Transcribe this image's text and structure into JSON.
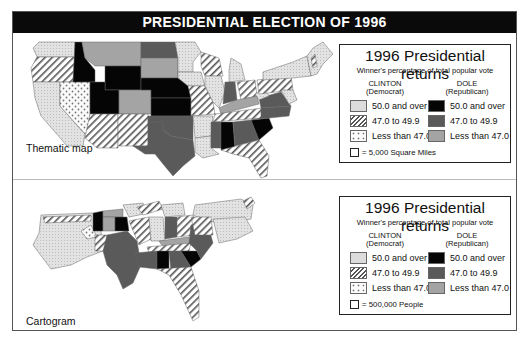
{
  "title": "PRESIDENTIAL ELECTION OF 1996",
  "colors": {
    "clinton_50_plus": "#d8d8d8",
    "clinton_47_49": "hatch",
    "clinton_under_47": "dotted",
    "dole_50_plus": "#050505",
    "dole_47_49": "#5a5a5a",
    "dole_under_47": "#a4a4a4"
  },
  "maps": [
    {
      "label": "Thematic map",
      "legend": {
        "title": "1996 Presidential returns",
        "subtitle": "Winner's percentage of total popular vote",
        "clinton_header": [
          "CLINTON",
          "(Democrat)"
        ],
        "dole_header": [
          "DOLE",
          "(Republican)"
        ],
        "clinton_rows": [
          "50.0 and over",
          "47.0 to 49.9",
          "Less than 47.0"
        ],
        "dole_rows": [
          "50.0 and over",
          "47.0 to 49.9",
          "Less than 47.0"
        ],
        "scale": "= 5,000 Square Miles"
      }
    },
    {
      "label": "Cartogram",
      "legend": {
        "title": "1996 Presidential returns",
        "subtitle": "Winner's percentage of total popular vote",
        "clinton_header": [
          "CLINTON",
          "(Democrat)"
        ],
        "dole_header": [
          "DOLE",
          "(Republican)"
        ],
        "clinton_rows": [
          "50.0 and over",
          "47.0 to 49.9",
          "Less than 47.0"
        ],
        "dole_rows": [
          "50.0 and over",
          "47.0 to 49.9",
          "Less than 47.0"
        ],
        "scale": "= 500,000 People"
      }
    }
  ]
}
